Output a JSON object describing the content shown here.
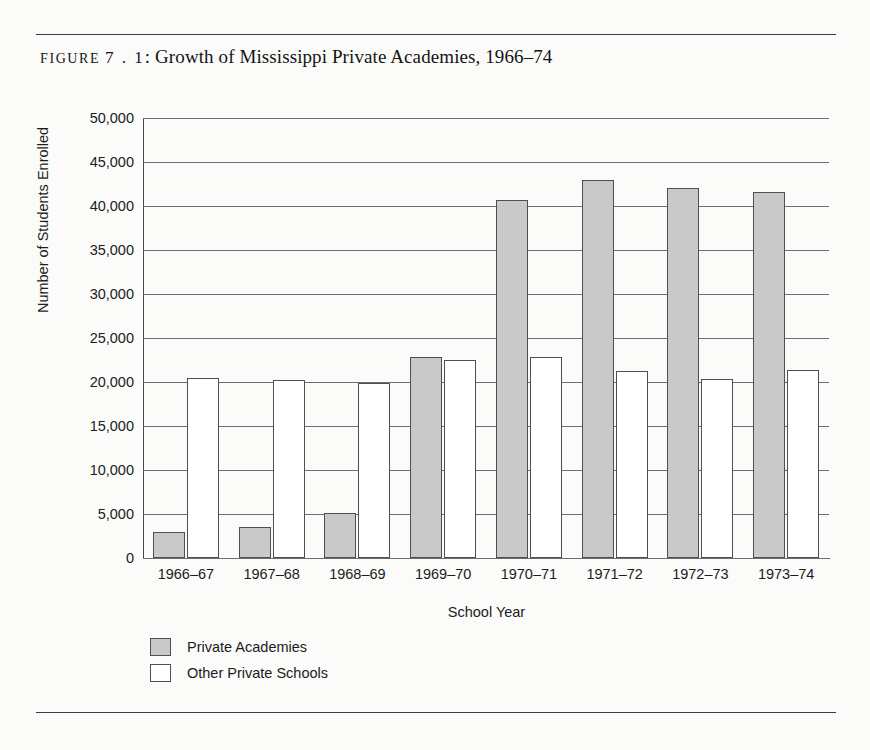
{
  "figure": {
    "label_word": "FIGURE",
    "number": "7 . 1",
    "separator": ":",
    "title": "Growth of Mississippi Private Academies, 1966–74",
    "caption_full": "FIGURE 7.1: Growth of Mississippi Private Academies, 1966–74"
  },
  "chart_data": {
    "type": "bar",
    "title": "Growth of Mississippi Private Academies, 1966–74",
    "xlabel": "School Year",
    "ylabel": "Number of Students Enrolled",
    "ylim": [
      0,
      50000
    ],
    "ytick_step": 5000,
    "yticks": [
      50000,
      45000,
      40000,
      35000,
      30000,
      25000,
      20000,
      15000,
      10000,
      5000,
      0
    ],
    "ytick_labels": [
      "50,000",
      "45,000",
      "40,000",
      "35,000",
      "30,000",
      "25,000",
      "20,000",
      "15,000",
      "10,000",
      "5,000",
      "0"
    ],
    "grid": true,
    "grid_axis": "y",
    "legend_position": "below-left",
    "categories": [
      "1966–67",
      "1967–68",
      "1968–69",
      "1969–70",
      "1970–71",
      "1971–72",
      "1972–73",
      "1973–74"
    ],
    "series": [
      {
        "name": "Private Academies",
        "color": "#c9c9c9",
        "values": [
          3000,
          3500,
          5100,
          22800,
          40700,
          43000,
          42100,
          41600
        ]
      },
      {
        "name": "Other Private Schools",
        "color": "#ffffff",
        "values": [
          20500,
          20200,
          19900,
          22500,
          22800,
          21200,
          20300,
          21400
        ]
      }
    ]
  },
  "legend": {
    "items": [
      {
        "label": "Private Academies",
        "swatch": "academies"
      },
      {
        "label": "Other Private Schools",
        "swatch": "other"
      }
    ]
  }
}
